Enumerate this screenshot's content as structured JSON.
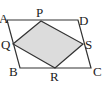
{
  "diagram": {
    "colors": {
      "stroke": "#333333",
      "fill": "#dcdcdc",
      "background": "#ffffff",
      "label": "#222222"
    },
    "points": {
      "A": {
        "label": "A"
      },
      "B": {
        "label": "B"
      },
      "C": {
        "label": "C"
      },
      "D": {
        "label": "D"
      },
      "P": {
        "label": "P"
      },
      "Q": {
        "label": "Q"
      },
      "R": {
        "label": "R"
      },
      "S": {
        "label": "S"
      }
    },
    "outer_shape": "ABCD",
    "inner_shape": "PQRS",
    "inner_shaded": true
  }
}
